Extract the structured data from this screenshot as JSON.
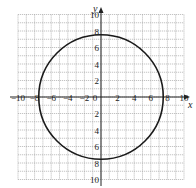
{
  "chart_data": {
    "type": "line",
    "title": "",
    "xlabel": "x",
    "ylabel": "y",
    "xlim": [
      -10,
      10
    ],
    "ylim": [
      -10,
      10
    ],
    "grid": true,
    "grid_step": 1,
    "x_ticks": [
      -10,
      -8,
      -6,
      -4,
      -2,
      0,
      2,
      4,
      6,
      8,
      10
    ],
    "x_tick_labels": [
      "−10",
      "−8",
      "−6",
      "−4",
      "−2",
      "0",
      "2",
      "4",
      "6",
      "8",
      "10"
    ],
    "y_ticks": [
      10,
      8,
      6,
      4,
      2,
      -2,
      -4,
      -6,
      -8,
      -10
    ],
    "y_tick_labels": [
      "10",
      "8",
      "6",
      "4",
      "2",
      "2",
      "4",
      "6",
      "8",
      "10"
    ],
    "series": [
      {
        "name": "circle",
        "shape": "circle",
        "center": [
          0,
          0
        ],
        "radius": 7.5,
        "color": "#1a1a1a"
      }
    ]
  },
  "axes": {
    "x_label": "x",
    "y_label": "y"
  }
}
